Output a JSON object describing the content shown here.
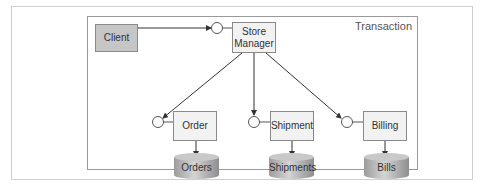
{
  "diagram": {
    "container_label": "Transaction",
    "nodes": {
      "client": "Client",
      "store_manager_line1": "Store",
      "store_manager_line2": "Manager",
      "order": "Order",
      "shipment": "Shipment",
      "billing": "Billing"
    },
    "datastores": {
      "orders": "Orders",
      "shipments": "Shipments",
      "bills": "Bills"
    },
    "edges": [
      {
        "from": "Client",
        "to": "Store Manager interface"
      },
      {
        "from": "Store Manager",
        "to": "Order interface"
      },
      {
        "from": "Store Manager",
        "to": "Shipment interface"
      },
      {
        "from": "Store Manager",
        "to": "Billing interface"
      },
      {
        "from": "Order",
        "to": "Orders"
      },
      {
        "from": "Shipment",
        "to": "Shipments"
      },
      {
        "from": "Billing",
        "to": "Bills"
      }
    ],
    "colors": {
      "client_fill": "#c6c6c6",
      "component_fill": "#f2f2f2",
      "border": "#8a8a8a",
      "cylinder": "#b5b5b5"
    }
  }
}
